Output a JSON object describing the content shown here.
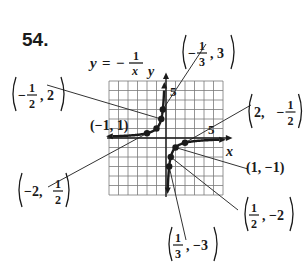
{
  "problem_number": "54.",
  "chart_data": {
    "type": "line",
    "equation": {
      "lhs": "y",
      "eq": "=",
      "sign": "−",
      "num": "1",
      "den": "x"
    },
    "xlabel": "x",
    "ylabel": "y",
    "xlim": [
      -6,
      6
    ],
    "ylim": [
      -6,
      6
    ],
    "grid": true,
    "x_tick_label": "5",
    "y_tick_label": "5",
    "series": [
      {
        "name": "left branch (x<0)",
        "x": [
          -6,
          -3,
          -2,
          -1,
          -0.5,
          -0.333,
          -0.2
        ],
        "y": [
          0.167,
          0.333,
          0.5,
          1,
          2,
          3,
          5
        ]
      },
      {
        "name": "right branch (x>0)",
        "x": [
          0.2,
          0.333,
          0.5,
          1,
          2,
          3,
          6
        ],
        "y": [
          -5,
          -3,
          -2,
          -1,
          -0.5,
          -0.333,
          -0.167
        ]
      }
    ],
    "labeled_points": [
      {
        "x": -0.3333,
        "y": 3,
        "label": {
          "pre": "(",
          "sign": "−",
          "num": "1",
          "den": "3",
          "post": ", 3)"
        }
      },
      {
        "x": -0.5,
        "y": 2,
        "label": {
          "pre": "(",
          "sign": "−",
          "num": "1",
          "den": "2",
          "post": ", 2)"
        }
      },
      {
        "x": -1,
        "y": 1,
        "label": {
          "text": "(−1, 1)"
        }
      },
      {
        "x": -2,
        "y": 0.5,
        "label": {
          "pre": "(−2, ",
          "num": "1",
          "den": "2",
          "post": ")"
        }
      },
      {
        "x": 2,
        "y": -0.5,
        "label": {
          "pre": "(2, ",
          "sign": "−",
          "num": "1",
          "den": "2",
          "post": ")"
        }
      },
      {
        "x": 1,
        "y": -1,
        "label": {
          "text": "(1, −1)"
        }
      },
      {
        "x": 0.5,
        "y": -2,
        "label": {
          "pre": "(",
          "num": "1",
          "den": "2",
          "post": ", −2)"
        }
      },
      {
        "x": 0.3333,
        "y": -3,
        "label": {
          "pre": "(",
          "num": "1",
          "den": "3",
          "post": ", −3)"
        }
      }
    ]
  },
  "colors": {
    "ink": "#1a1a1a",
    "grid": "#7a7a7a",
    "leader": "#333333"
  }
}
